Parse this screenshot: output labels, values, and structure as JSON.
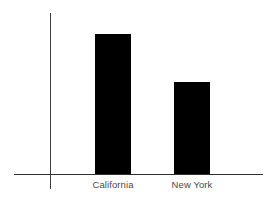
{
  "chart_data": {
    "type": "bar",
    "title": "",
    "subtitle": "",
    "xlabel": "",
    "ylabel": "",
    "categories": [
      "California",
      "New York"
    ],
    "values": [
      131,
      86
    ],
    "ylim": [
      0,
      162
    ],
    "grid": false,
    "legend": null,
    "series": [
      {
        "name": "",
        "values": [
          131,
          86
        ]
      }
    ],
    "annotations": [],
    "tick_labels": {
      "x": [
        "California",
        "New York"
      ],
      "y": []
    },
    "colors": {
      "bar": "#000000",
      "axis": "#2e2e2e",
      "axis_y": "#3d3d3d",
      "label": "#4a4a4a",
      "background": "#ffffff"
    }
  }
}
